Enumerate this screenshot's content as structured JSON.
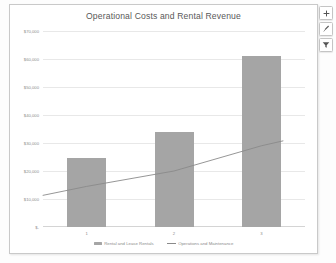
{
  "chart_data": {
    "type": "bar",
    "title": "Operational Costs and Rental Revenue",
    "categories": [
      "1",
      "2",
      "3"
    ],
    "xlabel": "",
    "ylabel": "",
    "ylim": [
      0,
      70000
    ],
    "ytick_labels": [
      "$70,000",
      "$60,000",
      "$50,000",
      "$40,000",
      "$30,000",
      "$20,000",
      "$10,000",
      "$-"
    ],
    "ytick_values": [
      70000,
      60000,
      50000,
      40000,
      30000,
      20000,
      10000,
      0
    ],
    "grid": true,
    "legend_position": "bottom",
    "series": [
      {
        "name": "Rental and Lease Rentals",
        "type": "bar",
        "color": "#a5a5a5",
        "values": [
          24500,
          34000,
          61000
        ]
      },
      {
        "name": "Operations and Maintenance",
        "type": "line",
        "color": "#8a8a8a",
        "values": [
          14500,
          20000,
          29000
        ]
      }
    ]
  },
  "chart_buttons": [
    {
      "name": "chart-elements",
      "icon": "plus-icon"
    },
    {
      "name": "chart-styles",
      "icon": "brush-icon"
    },
    {
      "name": "chart-filters",
      "icon": "filter-icon"
    }
  ]
}
